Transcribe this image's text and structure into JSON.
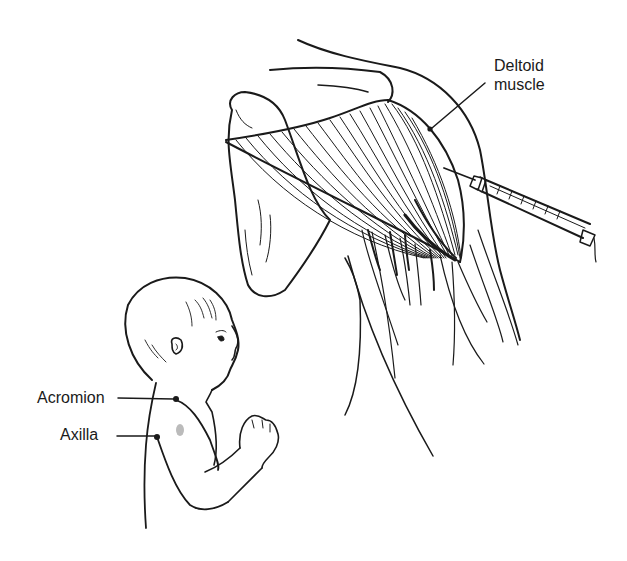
{
  "figure": {
    "labels": {
      "deltoid_line1": "Deltoid",
      "deltoid_line2": "muscle",
      "acromion": "Acromion",
      "axilla": "Axilla"
    },
    "icons": {
      "syringe": "syringe-icon",
      "shoulder_anatomy": "shoulder-muscle-illustration",
      "infant": "infant-illustration"
    },
    "colors": {
      "ink": "#1a1a1a",
      "background": "#ffffff"
    }
  }
}
